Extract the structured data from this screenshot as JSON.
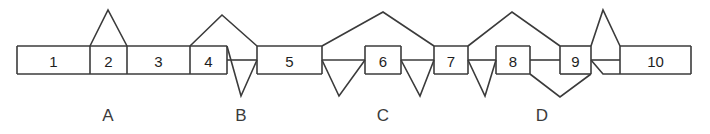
{
  "diagram": {
    "stroke_color": "#3b3b3b",
    "fill_color": "#ffffff",
    "background_color": "#ffffff",
    "bar": {
      "top": 46,
      "bottom": 74,
      "mid": 60,
      "left": 17,
      "right": 691
    },
    "segments": [
      {
        "label": "1",
        "x0": 17,
        "x1": 90,
        "cx": 53.5
      },
      {
        "label": "2",
        "x0": 90,
        "x1": 127,
        "cx": 108.5
      },
      {
        "label": "3",
        "x0": 127,
        "x1": 190,
        "cx": 158.5
      },
      {
        "label": "4",
        "x0": 190,
        "x1": 227,
        "cx": 208.5
      },
      {
        "label": "5",
        "x0": 257,
        "x1": 322,
        "cx": 289.5
      },
      {
        "label": "6",
        "x0": 365,
        "x1": 401,
        "cx": 383
      },
      {
        "label": "7",
        "x0": 434,
        "x1": 468,
        "cx": 451
      },
      {
        "label": "8",
        "x0": 496,
        "x1": 530,
        "cx": 513
      },
      {
        "label": "9",
        "x0": 560,
        "x1": 591,
        "cx": 575.5
      },
      {
        "label": "10",
        "x0": 620,
        "x1": 691,
        "cx": 655.5
      }
    ],
    "region_labels": [
      {
        "label": "A",
        "x": 108,
        "y": 115
      },
      {
        "label": "B",
        "x": 241,
        "y": 115
      },
      {
        "label": "C",
        "x": 383,
        "y": 115
      },
      {
        "label": "D",
        "x": 542,
        "y": 115
      }
    ],
    "loops_above": [
      {
        "name": "peak-above-segment-2",
        "points": "90,46 108,10 127,46"
      },
      {
        "name": "peak-above-segment-4",
        "points": "190,46 222,15 257,46"
      },
      {
        "name": "peak-above-segment-6",
        "points": "322,46 383,12 434,46"
      },
      {
        "name": "peak-above-segment-8",
        "points": "468,46 512,12 560,46"
      },
      {
        "name": "peak-above-segment-9",
        "points": "591,46 603,10 620,46"
      }
    ],
    "loops_below": [
      {
        "name": "vee-below-segment-4",
        "points": "227,46 241,96 257,60"
      },
      {
        "name": "vee-below-segment-5",
        "points": "322,60 339,96 365,60"
      },
      {
        "name": "vee-below-segment-6",
        "points": "401,60 420,96 434,60"
      },
      {
        "name": "vee-below-segment-7",
        "points": "468,60 485,96 496,60"
      },
      {
        "name": "vee-below-segment-8",
        "points": "530,74 560,97 591,74"
      },
      {
        "name": "vee-below-segment-9",
        "points": "591,60 603,74 620,74"
      }
    ],
    "connector_lines": [
      {
        "name": "midline-segment-4-gap",
        "x0": 227,
        "x1": 257,
        "y": 60
      },
      {
        "name": "midline-segment-6-left",
        "x0": 322,
        "x1": 365,
        "y": 60
      },
      {
        "name": "midline-segment-6-right",
        "x0": 401,
        "x1": 434,
        "y": 60
      },
      {
        "name": "midline-segment-7-right",
        "x0": 468,
        "x1": 496,
        "y": 60
      },
      {
        "name": "midline-segment-9-left",
        "x0": 530,
        "x1": 560,
        "y": 60
      },
      {
        "name": "midline-segment-9-right",
        "x0": 591,
        "x1": 620,
        "y": 60
      }
    ],
    "bar_top_spans": [
      {
        "name": "bartop-1-to-4",
        "x0": 17,
        "x1": 227
      },
      {
        "name": "bartop-5",
        "x0": 257,
        "x1": 322
      },
      {
        "name": "bartop-6",
        "x0": 365,
        "x1": 401
      },
      {
        "name": "bartop-7",
        "x0": 434,
        "x1": 468
      },
      {
        "name": "bartop-8",
        "x0": 496,
        "x1": 530
      },
      {
        "name": "bartop-9",
        "x0": 560,
        "x1": 591
      },
      {
        "name": "bartop-10",
        "x0": 620,
        "x1": 691
      }
    ],
    "bar_bottom_spans": [
      {
        "name": "barbot-1-to-4",
        "x0": 17,
        "x1": 227
      },
      {
        "name": "barbot-5",
        "x0": 257,
        "x1": 322
      },
      {
        "name": "barbot-6",
        "x0": 365,
        "x1": 401
      },
      {
        "name": "barbot-7",
        "x0": 434,
        "x1": 468
      },
      {
        "name": "barbot-8",
        "x0": 496,
        "x1": 530
      },
      {
        "name": "barbot-9",
        "x0": 560,
        "x1": 591
      },
      {
        "name": "barbot-10",
        "x0": 620,
        "x1": 691
      }
    ],
    "dividers": [
      {
        "name": "divider-1-2",
        "x": 90
      },
      {
        "name": "divider-2-3",
        "x": 127
      },
      {
        "name": "divider-3-4",
        "x": 190
      },
      {
        "name": "divider-4-right",
        "x": 227
      },
      {
        "name": "divider-5-left",
        "x": 257
      },
      {
        "name": "divider-5-right",
        "x": 322
      },
      {
        "name": "divider-6-left",
        "x": 365
      },
      {
        "name": "divider-6-right",
        "x": 401
      },
      {
        "name": "divider-7-left",
        "x": 434
      },
      {
        "name": "divider-7-right",
        "x": 468
      },
      {
        "name": "divider-8-left",
        "x": 496
      },
      {
        "name": "divider-8-right",
        "x": 530
      },
      {
        "name": "divider-9-left",
        "x": 560
      },
      {
        "name": "divider-9-right",
        "x": 591
      },
      {
        "name": "divider-10-left",
        "x": 620
      },
      {
        "name": "cap-left",
        "x": 17
      },
      {
        "name": "cap-right",
        "x": 691
      }
    ]
  }
}
